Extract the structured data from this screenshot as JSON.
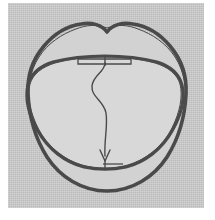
{
  "figure": {
    "kind": "hand-drawn-line-diagram",
    "caption_text": "",
    "title_text": "",
    "plate": {
      "background_color": "#c9c9c9",
      "page_color": "#ffffff",
      "left": 8,
      "top": 3,
      "width": 196,
      "height": 205
    },
    "ink": {
      "stroke_color": "#4a4a4a",
      "thick_stroke_width": 3.6,
      "thin_stroke_width": 1.3,
      "fill_color": "#d6d6d6"
    },
    "elements": [
      {
        "id": "outer-outline",
        "label": "outer contour",
        "stroke_width": 3.6,
        "description": "large rounded heart/lip shaped closed contour with a central notch at the top"
      },
      {
        "id": "inner-outline",
        "label": "inner contour",
        "stroke_width": 3.2,
        "description": "inner oval contour touching the outer contour at the left and right extremes"
      },
      {
        "id": "top-bar",
        "label": "upper reference bar",
        "stroke_width": 1.3,
        "x1": 78,
        "x2": 131,
        "y": 59,
        "description": "thin elongated rectangle spanning the upper inner contour"
      },
      {
        "id": "bottom-bar",
        "label": "lower reference bar",
        "stroke_width": 1.3,
        "x1": 103,
        "x2": 123,
        "y": 164,
        "description": "short horizontal segment at the lower inner contour"
      },
      {
        "id": "flow-arrow",
        "label": "wavy flow arrow",
        "stroke_width": 1.3,
        "start_x": 105,
        "start_y": 62,
        "end_x": 105,
        "end_y": 163,
        "direction": "downward",
        "description": "S-curved sinuous line running from the upper bar to the lower bar terminating in an arrowhead"
      }
    ]
  }
}
